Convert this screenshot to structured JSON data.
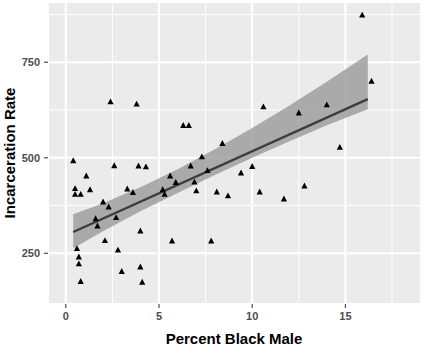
{
  "chart_data": {
    "type": "scatter",
    "title": "",
    "xlabel": "Percent Black Male",
    "ylabel": "Incarceration Rate",
    "xlim": [
      -0.9,
      19.0
    ],
    "ylim": [
      120,
      905
    ],
    "xticks": [
      0,
      5,
      10,
      15
    ],
    "yticks": [
      250,
      500,
      750
    ],
    "xtick_labels": [
      "0",
      "5",
      "10",
      "15"
    ],
    "ytick_labels": [
      "250",
      "500",
      "750"
    ],
    "x_minor_ticks": [
      2.5,
      7.5,
      12.5,
      17.5
    ],
    "y_minor_ticks": [
      375,
      625,
      875
    ],
    "grid": true,
    "grid_color": "#ffffff",
    "panel_background": "#ebebeb",
    "legend": "none",
    "marker": "triangle-up",
    "marker_color": "#000000",
    "marker_size": 5,
    "smoother": {
      "method": "lm",
      "line_color": "#3c3c3c",
      "ribbon_color": "#9a9a9a",
      "ribbon_alpha": 0.8,
      "intercept": 297,
      "slope": 22.0,
      "se_band": {
        "x": [
          0.4,
          2.0,
          4.0,
          6.0,
          8.0,
          10.0,
          12.0,
          14.0,
          16.2
        ],
        "upper": [
          352,
          381,
          423,
          470,
          522,
          578,
          637,
          699,
          770
        ],
        "lower": [
          263,
          308,
          360,
          408,
          455,
          500,
          543,
          585,
          627
        ]
      }
    },
    "points": [
      {
        "x": 0.4,
        "y": 492
      },
      {
        "x": 0.5,
        "y": 419
      },
      {
        "x": 0.5,
        "y": 404
      },
      {
        "x": 0.6,
        "y": 262
      },
      {
        "x": 0.7,
        "y": 240
      },
      {
        "x": 0.7,
        "y": 222
      },
      {
        "x": 0.8,
        "y": 404
      },
      {
        "x": 0.8,
        "y": 176
      },
      {
        "x": 1.1,
        "y": 452
      },
      {
        "x": 1.3,
        "y": 416
      },
      {
        "x": 1.6,
        "y": 340
      },
      {
        "x": 1.7,
        "y": 321
      },
      {
        "x": 2.0,
        "y": 384
      },
      {
        "x": 2.1,
        "y": 283
      },
      {
        "x": 2.3,
        "y": 371
      },
      {
        "x": 2.4,
        "y": 646
      },
      {
        "x": 2.6,
        "y": 479
      },
      {
        "x": 2.7,
        "y": 343
      },
      {
        "x": 2.8,
        "y": 258
      },
      {
        "x": 3.0,
        "y": 202
      },
      {
        "x": 3.3,
        "y": 418
      },
      {
        "x": 3.6,
        "y": 409
      },
      {
        "x": 3.8,
        "y": 640
      },
      {
        "x": 3.9,
        "y": 478
      },
      {
        "x": 4.0,
        "y": 308
      },
      {
        "x": 4.0,
        "y": 214
      },
      {
        "x": 4.1,
        "y": 174
      },
      {
        "x": 4.3,
        "y": 476
      },
      {
        "x": 5.2,
        "y": 416
      },
      {
        "x": 5.3,
        "y": 404
      },
      {
        "x": 5.6,
        "y": 452
      },
      {
        "x": 5.7,
        "y": 282
      },
      {
        "x": 5.9,
        "y": 435
      },
      {
        "x": 6.3,
        "y": 584
      },
      {
        "x": 6.6,
        "y": 584
      },
      {
        "x": 6.7,
        "y": 478
      },
      {
        "x": 6.9,
        "y": 436
      },
      {
        "x": 7.0,
        "y": 413
      },
      {
        "x": 7.3,
        "y": 502
      },
      {
        "x": 7.6,
        "y": 466
      },
      {
        "x": 7.8,
        "y": 282
      },
      {
        "x": 8.1,
        "y": 410
      },
      {
        "x": 8.4,
        "y": 537
      },
      {
        "x": 8.7,
        "y": 400
      },
      {
        "x": 9.4,
        "y": 460
      },
      {
        "x": 10.0,
        "y": 477
      },
      {
        "x": 10.4,
        "y": 410
      },
      {
        "x": 10.6,
        "y": 633
      },
      {
        "x": 11.7,
        "y": 392
      },
      {
        "x": 12.5,
        "y": 617
      },
      {
        "x": 12.8,
        "y": 426
      },
      {
        "x": 14.0,
        "y": 638
      },
      {
        "x": 14.7,
        "y": 527
      },
      {
        "x": 15.9,
        "y": 873
      },
      {
        "x": 16.4,
        "y": 700
      }
    ]
  },
  "axis": {
    "y_title": "Incarceration Rate",
    "x_title": "Percent Black Male"
  }
}
